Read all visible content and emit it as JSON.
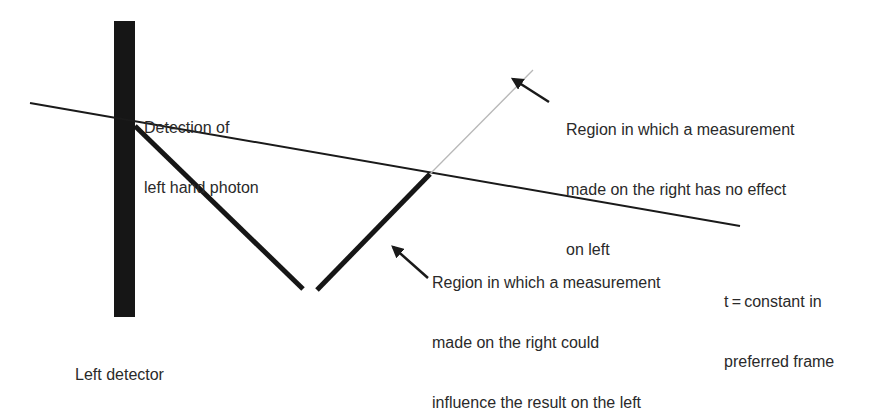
{
  "diagram": {
    "type": "spacetime-diagram",
    "colors": {
      "background": "#ffffff",
      "ink": "#1a1a1a",
      "thin_line": "#b8b8b8",
      "text": "#2a2a2a"
    },
    "labels": {
      "detection": [
        "Detection of",
        "left hand photon"
      ],
      "no_effect_region": [
        "Region in which a measurement",
        "made on the right has no effect",
        "on left"
      ],
      "influence_region": [
        "Region in which a measurement",
        "made on the right could",
        "influence the result on the left"
      ],
      "t_constant": [
        "t = constant in",
        "preferred frame"
      ],
      "left_detector": "Left detector"
    },
    "elements": {
      "left_detector_bar": {
        "x": 114,
        "y": 21,
        "width": 21,
        "height": 296
      },
      "t_constant_line": {
        "x1": 30,
        "y1": 103,
        "x2": 740,
        "y2": 226
      },
      "light_cone_left_edge": {
        "x1": 135,
        "y1": 126,
        "x2": 303,
        "y2": 289
      },
      "light_cone_right_edge": {
        "x1": 317,
        "y1": 290,
        "x2": 430,
        "y2": 174
      },
      "outside_cone_thin_line": {
        "x1": 430,
        "y1": 174,
        "x2": 533,
        "y2": 70
      },
      "arrow_no_effect": {
        "x1": 549,
        "y1": 102,
        "x2": 511,
        "y2": 78
      },
      "arrow_influence": {
        "x1": 428,
        "y1": 278,
        "x2": 391,
        "y2": 245
      }
    }
  }
}
